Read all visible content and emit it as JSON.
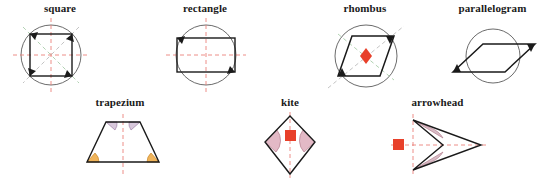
{
  "page": {
    "background_color": "#ffffff",
    "width": 550,
    "height": 183
  },
  "palette": {
    "outline": "#1a1a1a",
    "circle": "#5a5a5a",
    "axis_dashed_red": "#e8726a",
    "diagonal_dashed_green": "#9ec6a0",
    "diagonal_dashed_gray": "#b4b4b4",
    "marker_red": "#e8402a",
    "angle_arc_lavender": "#d8c8dc",
    "angle_arc_lavender_stroke": "#9e7fa6",
    "angle_arc_orange": "#f0b45a",
    "angle_arc_orange_stroke": "#c98a2e",
    "angle_arc_pink": "#e3b9c6",
    "angle_arc_pink_stroke": "#b5808f",
    "label_text": "#1a1a1a"
  },
  "figures": [
    {
      "id": "square",
      "label": "square",
      "row": "top",
      "symmetry": "4 lines of symmetry, rotational order 4",
      "has_circumcircle": true,
      "markers": {
        "center_marker": "none",
        "arrow_count": 4
      },
      "dashed_axes": [
        "horizontal",
        "vertical"
      ],
      "dashed_diagonals": [
        "both"
      ],
      "angle_arcs": []
    },
    {
      "id": "rectangle",
      "label": "rectangle",
      "row": "top",
      "symmetry": "2 lines of symmetry, rotational order 2",
      "has_circumcircle": true,
      "markers": {
        "center_marker": "none",
        "arrow_count": 2
      },
      "dashed_axes": [
        "horizontal",
        "vertical"
      ],
      "dashed_diagonals": [],
      "angle_arcs": []
    },
    {
      "id": "rhombus",
      "label": "rhombus",
      "row": "top",
      "symmetry": "2 lines of symmetry, rotational order 2",
      "has_circumcircle": true,
      "markers": {
        "center_marker": "diamond",
        "arrow_count": 2
      },
      "dashed_axes": [],
      "dashed_diagonals": [
        "both"
      ],
      "angle_arcs": []
    },
    {
      "id": "parallelogram",
      "label": "parallelogram",
      "row": "top",
      "symmetry": "no lines of symmetry, rotational order 2",
      "has_circumcircle": true,
      "markers": {
        "center_marker": "none",
        "arrow_count": 2
      },
      "dashed_axes": [],
      "dashed_diagonals": [],
      "angle_arcs": []
    },
    {
      "id": "trapezium",
      "label": "trapezium",
      "row": "bottom",
      "symmetry": "1 line of symmetry (vertical)",
      "has_circumcircle": false,
      "markers": {
        "center_marker": "none",
        "arrow_count": 0
      },
      "dashed_axes": [
        "vertical"
      ],
      "dashed_diagonals": [],
      "angle_arcs": [
        "lavender-top-left",
        "lavender-top-right",
        "orange-bottom-left",
        "orange-bottom-right"
      ]
    },
    {
      "id": "kite",
      "label": "kite",
      "row": "bottom",
      "symmetry": "1 line of symmetry (vertical)",
      "has_circumcircle": false,
      "markers": {
        "center_marker": "square",
        "arrow_count": 0
      },
      "dashed_axes": [
        "vertical"
      ],
      "dashed_diagonals": [],
      "angle_arcs": [
        "pink-left",
        "pink-right"
      ]
    },
    {
      "id": "arrowhead",
      "label": "arrowhead",
      "row": "bottom",
      "symmetry": "1 line of symmetry (horizontal)",
      "has_circumcircle": false,
      "markers": {
        "center_marker": "square",
        "arrow_count": 0
      },
      "dashed_axes": [
        "horizontal",
        "vertical"
      ],
      "dashed_diagonals": [],
      "angle_arcs": [
        "pink-upper",
        "pink-lower"
      ]
    }
  ]
}
